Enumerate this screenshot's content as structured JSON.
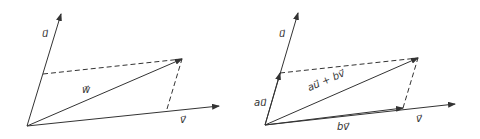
{
  "diagrams": [
    {
      "name": "vector-sum-left",
      "labels": {
        "u": "u⃗",
        "v": "v⃗",
        "w": "w⃗"
      }
    },
    {
      "name": "vector-decomposition-right",
      "labels": {
        "u": "u⃗",
        "v": "v⃗",
        "au": "au⃗",
        "bv": "bv⃗",
        "sum": "au⃗ + bv⃗"
      }
    }
  ],
  "colors": {
    "line": "#333333",
    "background": "#ffffff"
  }
}
